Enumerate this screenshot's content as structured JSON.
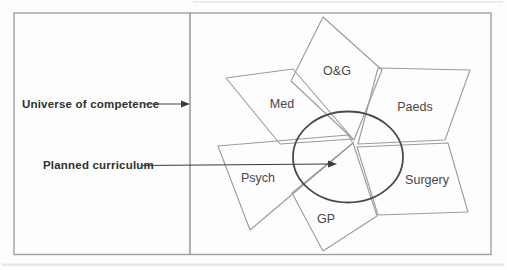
{
  "diagram": {
    "annotations": [
      {
        "label": "Universe of competence"
      },
      {
        "label": "Planned curriculum"
      }
    ],
    "shapes": [
      {
        "label": "O&G"
      },
      {
        "label": "Med"
      },
      {
        "label": "Paeds"
      },
      {
        "label": "Psych"
      },
      {
        "label": "Surgery"
      },
      {
        "label": "GP"
      }
    ],
    "colors": {
      "frame_stroke": "#a0a0a0",
      "divider_stroke": "#8f8f8f",
      "shape_stroke": "#9b9b9b",
      "circle_stroke": "#4a4a4a",
      "arrow_color": "#3c3c3c",
      "annotation_text": "#2f2f2f",
      "shape_label_text": "#474747",
      "background": "#fdfdfd"
    }
  }
}
